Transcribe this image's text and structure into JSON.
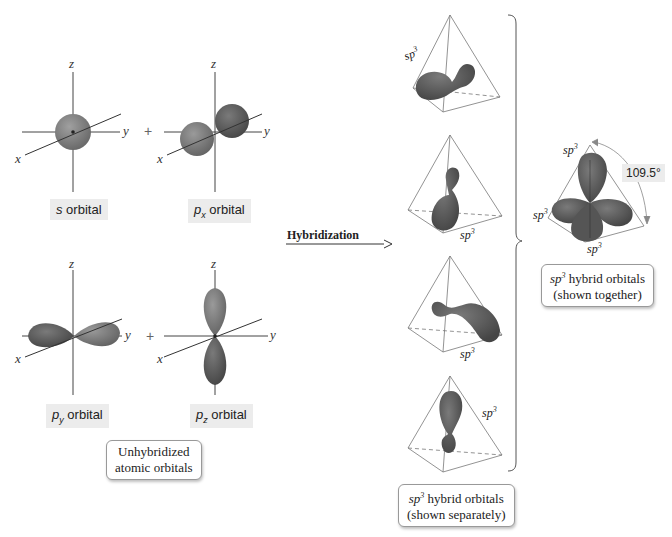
{
  "axes": {
    "x": "x",
    "y": "y",
    "z": "z"
  },
  "operator": "+",
  "unhybridized": {
    "orbitals": [
      {
        "id": "s",
        "main": "s",
        "sub": "",
        "suffix": " orbital"
      },
      {
        "id": "px",
        "main": "p",
        "sub": "x",
        "suffix": " orbital"
      },
      {
        "id": "py",
        "main": "p",
        "sub": "y",
        "suffix": " orbital"
      },
      {
        "id": "pz",
        "main": "p",
        "sub": "z",
        "suffix": " orbital"
      }
    ],
    "caption_line1": "Unhybridized",
    "caption_line2": "atomic orbitals"
  },
  "process": {
    "label": "Hybridization"
  },
  "hybrid": {
    "sp_base": "sp",
    "sp_exp": "3",
    "separate_caption_line1_suffix": " hybrid orbitals",
    "separate_caption_line2": "(shown separately)",
    "together_caption_line1_suffix": " hybrid orbitals",
    "together_caption_line2": "(shown together)",
    "bond_angle": "109.5°"
  },
  "colors": {
    "lobe_dark": "#5a5a5a",
    "lobe_light": "#8a8a8a",
    "line": "#444444",
    "label_bg": "#ececec"
  }
}
